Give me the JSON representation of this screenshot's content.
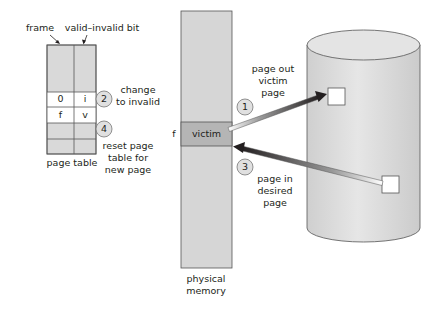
{
  "page_table": {
    "label": "page table",
    "col_labels": {
      "frame": "frame",
      "valid_bit": "valid–invalid bit"
    },
    "rows": [
      {
        "frame": "",
        "bit": ""
      },
      {
        "frame": "0",
        "bit": "i"
      },
      {
        "frame": "f",
        "bit": "v"
      },
      {
        "frame": "",
        "bit": ""
      },
      {
        "frame": "",
        "bit": ""
      }
    ]
  },
  "physical_memory": {
    "label_line1": "physical",
    "label_line2": "memory",
    "frame_label": "f",
    "victim_label": "victim"
  },
  "steps": [
    {
      "number": "1",
      "line1": "page out",
      "line2": "victim",
      "line3": "page"
    },
    {
      "number": "2",
      "line1": "change",
      "line2": "to invalid"
    },
    {
      "number": "3",
      "line1": "page in",
      "line2": "desired",
      "line3": "page"
    },
    {
      "number": "4",
      "line1": "reset page",
      "line2": "table for",
      "line3": "new page"
    }
  ],
  "colors": {
    "table_fill": "#d9d9d9",
    "memory_fill": "#d6d6d6",
    "victim_fill": "#b5b5b5",
    "disk_fill": "#dcdcdc",
    "circle_fill": "#e0e0e0",
    "arrow_dark": "#231f20",
    "stroke": "#555555"
  }
}
